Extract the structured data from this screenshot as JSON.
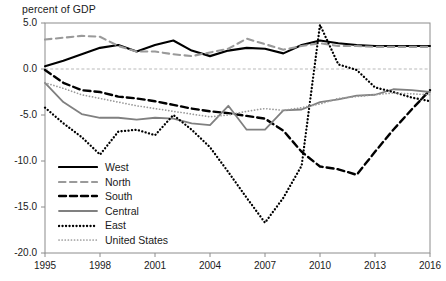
{
  "chart_data": {
    "type": "line",
    "title": "",
    "ylabel": "percent of GDP",
    "xlabel": "",
    "ylim": [
      -20.0,
      5.0
    ],
    "xlim": [
      1995,
      2016
    ],
    "grid": "zero-line-only",
    "legend_position": "inside-lower-left",
    "y_ticks": [
      "5.0",
      "0.0",
      "-5.0",
      "-10.0",
      "-15.0",
      "-20.0"
    ],
    "y_tick_values": [
      5.0,
      0.0,
      -5.0,
      -10.0,
      -15.0,
      -20.0
    ],
    "x_ticks": [
      "1995",
      "1998",
      "2001",
      "2004",
      "2007",
      "2010",
      "2013",
      "2016"
    ],
    "x_tick_values": [
      1995,
      1998,
      2001,
      2004,
      2007,
      2010,
      2013,
      2016
    ],
    "x": [
      1995,
      1996,
      1997,
      1998,
      1999,
      2000,
      2001,
      2002,
      2003,
      2004,
      2005,
      2006,
      2007,
      2008,
      2009,
      2010,
      2011,
      2012,
      2013,
      2014,
      2015,
      2016
    ],
    "series": [
      {
        "name": "West",
        "style": "solid",
        "color": "#000000",
        "width": 2.1,
        "values": [
          0.3,
          0.9,
          1.6,
          2.3,
          2.6,
          1.9,
          2.6,
          3.1,
          2.0,
          1.4,
          2.0,
          2.3,
          2.2,
          1.7,
          2.6,
          3.1,
          2.8,
          2.6,
          2.5,
          2.5,
          2.5,
          2.5
        ]
      },
      {
        "name": "North",
        "style": "dashed",
        "color": "#9a9a9a",
        "width": 2.1,
        "values": [
          3.2,
          3.4,
          3.6,
          3.5,
          2.5,
          1.9,
          1.9,
          1.6,
          1.4,
          1.8,
          2.2,
          3.3,
          2.7,
          2.1,
          2.5,
          2.8,
          2.5,
          2.5,
          2.4,
          2.4,
          2.4,
          2.4
        ]
      },
      {
        "name": "South",
        "style": "dashed",
        "color": "#000000",
        "width": 2.4,
        "values": [
          -0.1,
          -1.5,
          -2.3,
          -2.5,
          -3.0,
          -3.2,
          -3.5,
          -3.9,
          -4.3,
          -4.6,
          -4.8,
          -5.1,
          -5.4,
          -6.7,
          -9.0,
          -10.6,
          -10.9,
          -11.5,
          -9.0,
          -6.6,
          -4.4,
          -2.3
        ]
      },
      {
        "name": "Central",
        "style": "solid",
        "color": "#808080",
        "width": 1.8,
        "values": [
          -1.5,
          -3.6,
          -4.9,
          -5.3,
          -5.3,
          -5.5,
          -5.3,
          -5.4,
          -5.9,
          -6.1,
          -4.0,
          -6.6,
          -6.6,
          -4.5,
          -4.4,
          -3.6,
          -3.3,
          -2.9,
          -2.8,
          -2.2,
          -2.3,
          -2.5
        ]
      },
      {
        "name": "East",
        "style": "dotted",
        "color": "#000000",
        "width": 2.3,
        "values": [
          -4.2,
          -5.9,
          -7.4,
          -9.3,
          -6.8,
          -6.6,
          -7.2,
          -5.0,
          -6.6,
          -8.5,
          -11.2,
          -14.0,
          -16.7,
          -14.0,
          -10.5,
          4.8,
          0.5,
          -0.1,
          -2.0,
          -2.5,
          -3.1,
          -3.5
        ]
      },
      {
        "name": "United States",
        "style": "dotted",
        "color": "#9a9a9a",
        "width": 1.7,
        "values": [
          -1.5,
          -2.1,
          -2.8,
          -3.2,
          -3.6,
          -4.0,
          -4.3,
          -4.6,
          -4.9,
          -5.2,
          -5.0,
          -4.6,
          -4.3,
          -4.5,
          -4.2,
          -3.8,
          -3.2,
          -3.0,
          -2.8,
          -2.6,
          -2.7,
          -2.8
        ]
      }
    ]
  },
  "legend": {
    "items": [
      {
        "label": "West"
      },
      {
        "label": "North"
      },
      {
        "label": "South"
      },
      {
        "label": "Central"
      },
      {
        "label": "East"
      },
      {
        "label": "United States"
      }
    ]
  }
}
